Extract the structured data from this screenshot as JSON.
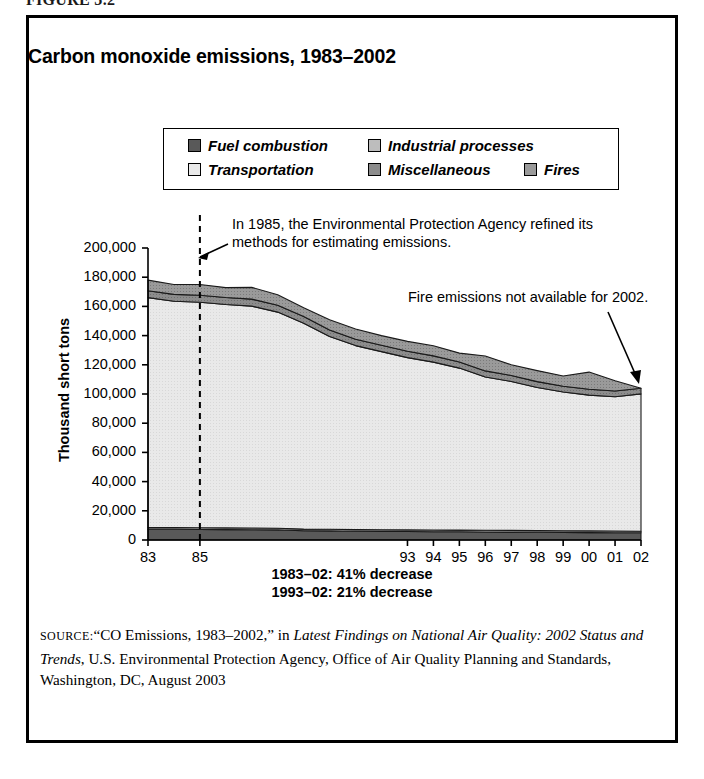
{
  "figure": {
    "number_label": "FIGURE 3.2"
  },
  "chart_title": "Carbon monoxide emissions, 1983–2002",
  "legend": {
    "items": [
      {
        "label": "Fuel combustion",
        "color": "#595959",
        "pattern": "solid"
      },
      {
        "label": "Industrial processes",
        "color": "#bdbdbd",
        "pattern": "solid"
      },
      {
        "label": "Transportation",
        "color": "#e9e9e9",
        "pattern": "solid"
      },
      {
        "label": "Miscellaneous",
        "color": "#8c8c8c",
        "pattern": "hatch"
      },
      {
        "label": "Fires",
        "color": "#9a9a9a",
        "pattern": "hatch"
      }
    ]
  },
  "annotations": [
    {
      "id": "epa-1985-note",
      "line1": "In 1985, the Environmental Protection Agency refined its",
      "line2": "methods for estimating emissions."
    },
    {
      "id": "fires-2002-note",
      "line1": "Fire emissions not available for 2002."
    }
  ],
  "footnotes": [
    "1983–02: 41% decrease",
    "1993–02: 21% decrease"
  ],
  "source": {
    "label": "SOURCE:",
    "text_1": "“CO Emissions, 1983–2002,” in ",
    "italic_1": "Latest Findings on National Air Quality: 2002 Status and Trends",
    "text_2": ", U.S. Environmental Protection Agency, Office of Air Quality Planning and Standards, Washington, DC, August 2003"
  },
  "chart_data": {
    "type": "area",
    "title": "Carbon monoxide emissions, 1983–2002",
    "xlabel": "",
    "ylabel": "Thousand short tons",
    "ylim": [
      0,
      200000
    ],
    "ytick_labels": [
      "200,000",
      "180,000",
      "160,000",
      "140,000",
      "120,000",
      "100,000",
      "80,000",
      "60,000",
      "40,000",
      "20,000",
      "0"
    ],
    "ytick_values": [
      200000,
      180000,
      160000,
      140000,
      120000,
      100000,
      80000,
      60000,
      40000,
      20000,
      0
    ],
    "grid": false,
    "legend_position": "top",
    "stacked": true,
    "x": [
      1983,
      1984,
      1985,
      1986,
      1987,
      1988,
      1989,
      1990,
      1991,
      1992,
      1993,
      1994,
      1995,
      1996,
      1997,
      1998,
      1999,
      2000,
      2001,
      2002
    ],
    "xtick_labels": [
      "83",
      "",
      "85",
      "",
      "",
      "",
      "",
      "",
      "",
      "",
      "93",
      "94",
      "95",
      "96",
      "97",
      "98",
      "99",
      "00",
      "01",
      "02"
    ],
    "xtick_values": [
      1983,
      1985,
      1993,
      1994,
      1995,
      1996,
      1997,
      1998,
      1999,
      2000,
      2001,
      2002
    ],
    "series": [
      {
        "name": "Fuel combustion",
        "color": "#595959",
        "values": [
          7300,
          7300,
          7200,
          7100,
          7000,
          6900,
          6300,
          6200,
          6000,
          5900,
          5800,
          5700,
          5600,
          5500,
          5400,
          5300,
          5200,
          5100,
          5000,
          4900
        ]
      },
      {
        "name": "Industrial processes",
        "color": "#bdbdbd",
        "values": [
          1200,
          1200,
          1200,
          1200,
          1200,
          1200,
          1150,
          1150,
          1150,
          1150,
          1150,
          1150,
          1150,
          1150,
          1150,
          1150,
          1150,
          1150,
          1150,
          1150
        ]
      },
      {
        "name": "Transportation",
        "color": "#e9e9e9",
        "values": [
          157500,
          155000,
          154500,
          153000,
          152000,
          148000,
          141000,
          132000,
          126000,
          122000,
          118000,
          115000,
          111000,
          105000,
          102000,
          98000,
          95000,
          93000,
          92000,
          94000
        ]
      },
      {
        "name": "Miscellaneous",
        "color": "#8c8c8c",
        "values": [
          4700,
          4700,
          4800,
          4800,
          4800,
          4700,
          4600,
          4500,
          4400,
          4350,
          4300,
          4250,
          4200,
          4150,
          4100,
          4050,
          4000,
          3950,
          3900,
          3850
        ]
      },
      {
        "name": "Fires",
        "color": "#9a9a9a",
        "values": [
          7300,
          6800,
          7300,
          6800,
          8000,
          7200,
          6000,
          7000,
          7000,
          6600,
          6750,
          6900,
          6050,
          10200,
          7350,
          7500,
          6950,
          11800,
          7000,
          0
        ]
      }
    ],
    "totals": [
      178000,
      175000,
      175000,
      172900,
      173000,
      168000,
      159050,
      150850,
      144550,
      140000,
      136000,
      133000,
      128000,
      126000,
      120000,
      116000,
      112300,
      115000,
      113050,
      103900
    ],
    "annotations": [
      {
        "text": "In 1985, the Environmental Protection Agency refined its methods for estimating emissions.",
        "at_x": 1985
      },
      {
        "text": "Fire emissions not available for 2002.",
        "at_x": 2002
      }
    ],
    "reference_line": {
      "x": 1985,
      "style": "dashed"
    }
  }
}
